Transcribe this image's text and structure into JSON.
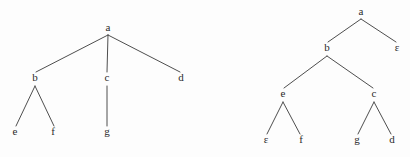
{
  "figure": {
    "background_color": "#fdfdfd",
    "line_color": "#3a3a3a",
    "text_color": "#2b2b2b",
    "width": 410,
    "height": 157
  },
  "trees": [
    {
      "id": "left-tree",
      "name": "left-tree",
      "root": "a",
      "nodes": [
        {
          "id": "L-a",
          "label": "a",
          "x": 108,
          "y": 31,
          "level": 0,
          "role": "root"
        },
        {
          "id": "L-b",
          "label": "b",
          "x": 35,
          "y": 81,
          "level": 1,
          "role": "internal"
        },
        {
          "id": "L-c",
          "label": "c",
          "x": 107,
          "y": 81,
          "level": 1,
          "role": "internal"
        },
        {
          "id": "L-d",
          "label": "d",
          "x": 181,
          "y": 81,
          "level": 1,
          "role": "leaf"
        },
        {
          "id": "L-e",
          "label": "e",
          "x": 15,
          "y": 135,
          "level": 2,
          "role": "leaf"
        },
        {
          "id": "L-f",
          "label": "f",
          "x": 53,
          "y": 135,
          "level": 2,
          "role": "leaf"
        },
        {
          "id": "L-g",
          "label": "g",
          "x": 107,
          "y": 135,
          "level": 2,
          "role": "leaf"
        }
      ],
      "edges": [
        {
          "id": "L-e1",
          "from": "L-a",
          "to": "L-b",
          "x1": 108,
          "y1": 35,
          "x2": 36,
          "y2": 72
        },
        {
          "id": "L-e2",
          "from": "L-a",
          "to": "L-c",
          "x1": 108,
          "y1": 35,
          "x2": 107,
          "y2": 72
        },
        {
          "id": "L-e3",
          "from": "L-a",
          "to": "L-d",
          "x1": 108,
          "y1": 35,
          "x2": 180,
          "y2": 72
        },
        {
          "id": "L-e4",
          "from": "L-b",
          "to": "L-e",
          "x1": 35,
          "y1": 86,
          "x2": 16,
          "y2": 126
        },
        {
          "id": "L-e5",
          "from": "L-b",
          "to": "L-f",
          "x1": 35,
          "y1": 86,
          "x2": 54,
          "y2": 126
        },
        {
          "id": "L-e6",
          "from": "L-c",
          "to": "L-g",
          "x1": 107,
          "y1": 86,
          "x2": 107,
          "y2": 126
        }
      ]
    },
    {
      "id": "right-tree",
      "name": "right-tree",
      "root": "a",
      "nodes": [
        {
          "id": "R-a",
          "label": "a",
          "x": 361,
          "y": 15,
          "level": 0,
          "role": "root"
        },
        {
          "id": "R-b",
          "label": "b",
          "x": 327,
          "y": 51,
          "level": 1,
          "role": "internal"
        },
        {
          "id": "R-eps1",
          "label": "ε",
          "x": 397,
          "y": 51,
          "level": 1,
          "role": "leaf"
        },
        {
          "id": "R-e",
          "label": "e",
          "x": 283,
          "y": 97,
          "level": 2,
          "role": "internal"
        },
        {
          "id": "R-c",
          "label": "c",
          "x": 374,
          "y": 97,
          "level": 2,
          "role": "internal"
        },
        {
          "id": "R-eps2",
          "label": "ε",
          "x": 266,
          "y": 143,
          "level": 3,
          "role": "leaf"
        },
        {
          "id": "R-f",
          "label": "f",
          "x": 301,
          "y": 143,
          "level": 3,
          "role": "leaf"
        },
        {
          "id": "R-g",
          "label": "g",
          "x": 357,
          "y": 143,
          "level": 3,
          "role": "leaf"
        },
        {
          "id": "R-d",
          "label": "d",
          "x": 392,
          "y": 143,
          "level": 3,
          "role": "leaf"
        }
      ],
      "edges": [
        {
          "id": "R-e1",
          "from": "R-a",
          "to": "R-b",
          "x1": 361,
          "y1": 19,
          "x2": 328,
          "y2": 42
        },
        {
          "id": "R-e2",
          "from": "R-a",
          "to": "R-eps1",
          "x1": 361,
          "y1": 19,
          "x2": 396,
          "y2": 42
        },
        {
          "id": "R-e3",
          "from": "R-b",
          "to": "R-e",
          "x1": 327,
          "y1": 56,
          "x2": 284,
          "y2": 88
        },
        {
          "id": "R-e4",
          "from": "R-b",
          "to": "R-c",
          "x1": 327,
          "y1": 56,
          "x2": 373,
          "y2": 88
        },
        {
          "id": "R-e5",
          "from": "R-e",
          "to": "R-eps2",
          "x1": 283,
          "y1": 102,
          "x2": 267,
          "y2": 134
        },
        {
          "id": "R-e6",
          "from": "R-e",
          "to": "R-f",
          "x1": 283,
          "y1": 102,
          "x2": 300,
          "y2": 134
        },
        {
          "id": "R-e7",
          "from": "R-c",
          "to": "R-g",
          "x1": 374,
          "y1": 102,
          "x2": 358,
          "y2": 134
        },
        {
          "id": "R-e8",
          "from": "R-c",
          "to": "R-d",
          "x1": 374,
          "y1": 102,
          "x2": 391,
          "y2": 134
        }
      ]
    }
  ]
}
